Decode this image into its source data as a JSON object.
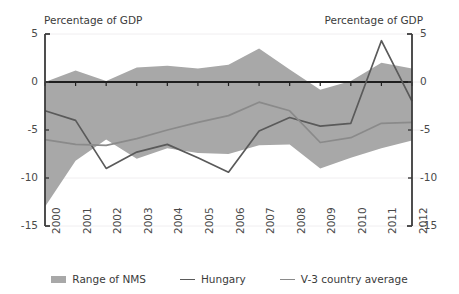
{
  "chart_data": {
    "type": "area",
    "title": "",
    "axis_title_left": "Percentage of GDP",
    "axis_title_right": "Percentage of GDP",
    "xlabel": "",
    "ylabel": "",
    "categories": [
      "2000",
      "2001",
      "2002",
      "2003",
      "2004",
      "2005",
      "2006",
      "2007",
      "2008",
      "2009",
      "2010",
      "2011",
      "2012"
    ],
    "ylim": [
      -15,
      5
    ],
    "yticks": [
      5,
      0,
      -5,
      -10,
      -15
    ],
    "ytick_labels_left": [
      "5",
      "0",
      "-5",
      "-10",
      "-15"
    ],
    "ytick_labels_right": [
      "5",
      "0",
      "-5",
      "-10",
      "-15"
    ],
    "grid": false,
    "legend_position": "bottom",
    "series": [
      {
        "name": "Range of NMS",
        "type": "band",
        "color": "#a8a8a8",
        "upper": [
          0.0,
          1.2,
          0.1,
          1.5,
          1.7,
          1.4,
          1.8,
          3.5,
          1.3,
          -0.8,
          0.1,
          2.0,
          1.4
        ],
        "lower": [
          -13.0,
          -8.2,
          -6.0,
          -8.0,
          -6.9,
          -7.4,
          -7.5,
          -6.6,
          -6.5,
          -9.0,
          -7.9,
          -6.9,
          -6.1
        ]
      },
      {
        "name": "Hungary",
        "type": "line",
        "color": "#5a5a5a",
        "values": [
          -3.0,
          -4.0,
          -9.0,
          -7.3,
          -6.5,
          -7.9,
          -9.4,
          -5.1,
          -3.7,
          -4.6,
          -4.3,
          4.3,
          -2.0
        ]
      },
      {
        "name": "V-3 country average",
        "type": "line",
        "color": "#8a8a8a",
        "values": [
          -6.0,
          -6.5,
          -6.6,
          -5.9,
          -5.0,
          -4.2,
          -3.5,
          -2.1,
          -3.0,
          -6.3,
          -5.8,
          -4.3,
          -4.2
        ]
      }
    ]
  },
  "legend": {
    "items": [
      {
        "label": "Range of NMS",
        "swatch": "band"
      },
      {
        "label": "Hungary",
        "swatch": "line-dark"
      },
      {
        "label": "V-3 country average",
        "swatch": "line-light"
      }
    ]
  }
}
